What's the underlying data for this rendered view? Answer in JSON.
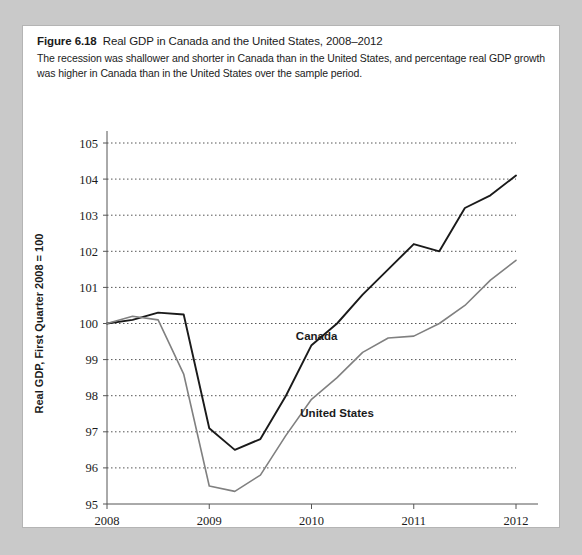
{
  "figure": {
    "label": "Figure 6.18",
    "title": "Real GDP in Canada and the United States, 2008–2012",
    "caption": "The recession was shallower and shorter in Canada than in the United States, and percentage real GDP growth was higher in Canada than in the United States over the sample period."
  },
  "colors": {
    "panel_background": "#ffffff",
    "outer_background": "#c9c9c9",
    "canada_line": "#1a1a1a",
    "united_states_line": "#808080",
    "gridline": "#555555",
    "axis": "#555555",
    "text": "#1b1b1b"
  },
  "chart_data": {
    "type": "line",
    "title": "Real GDP in Canada and the United States, 2008–2012",
    "xlabel": "Year",
    "ylabel": "Real GDP, First Quarter 2008 = 100",
    "xlim": [
      2008,
      2012
    ],
    "ylim": [
      95,
      105
    ],
    "xticks": [
      2008,
      2009,
      2010,
      2011,
      2012
    ],
    "xtick_labels": [
      "2008",
      "2009",
      "2010",
      "2011",
      "2012"
    ],
    "yticks": [
      95,
      96,
      97,
      98,
      99,
      100,
      101,
      102,
      103,
      104,
      105
    ],
    "ytick_labels": [
      "95",
      "96",
      "97",
      "98",
      "99",
      "100",
      "101",
      "102",
      "103",
      "104",
      "105"
    ],
    "grid": true,
    "grid_axis": "y",
    "grid_style": "dotted",
    "legend": "inline-labels",
    "x": [
      2008.0,
      2008.25,
      2008.5,
      2008.75,
      2009.0,
      2009.25,
      2009.5,
      2009.75,
      2010.0,
      2010.25,
      2010.5,
      2010.75,
      2011.0,
      2011.25,
      2011.5,
      2011.75,
      2012.0
    ],
    "x_labels": [
      "2008 Q1",
      "2008 Q2",
      "2008 Q3",
      "2008 Q4",
      "2009 Q1",
      "2009 Q2",
      "2009 Q3",
      "2009 Q4",
      "2010 Q1",
      "2010 Q2",
      "2010 Q3",
      "2010 Q4",
      "2011 Q1",
      "2011 Q2",
      "2011 Q3",
      "2011 Q4",
      "2012 Q1"
    ],
    "series": [
      {
        "name": "Canada",
        "color": "#1a1a1a",
        "label_x": 2010.05,
        "label_y": 99.55,
        "values": [
          100.0,
          100.1,
          100.3,
          100.25,
          97.1,
          96.5,
          96.8,
          98.0,
          99.4,
          100.0,
          100.8,
          101.5,
          102.2,
          102.0,
          103.2,
          103.55,
          104.1
        ]
      },
      {
        "name": "United States",
        "color": "#808080",
        "label_x": 2010.25,
        "label_y": 97.4,
        "values": [
          100.0,
          100.2,
          100.1,
          98.6,
          95.5,
          95.35,
          95.8,
          96.9,
          97.9,
          98.5,
          99.2,
          99.6,
          99.65,
          100.0,
          100.5,
          101.2,
          101.75
        ]
      }
    ]
  },
  "axis": {
    "y_title": "Real GDP, First Quarter 2008 = 100",
    "x_title": "Year"
  }
}
